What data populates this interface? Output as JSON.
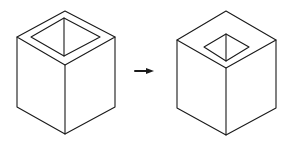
{
  "figure": {
    "left_cube": {
      "label": "",
      "opening": "large"
    },
    "arrow": {
      "direction": "right"
    },
    "right_cube": {
      "label": "",
      "opening": "small"
    },
    "colors": {
      "stroke": "#1a1a1a",
      "background": "#ffffff"
    }
  }
}
